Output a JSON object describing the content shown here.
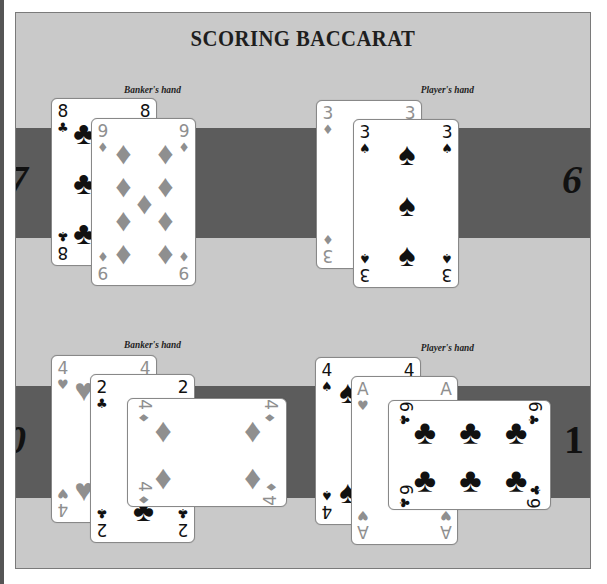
{
  "title": "SCORING BACCARAT",
  "colors": {
    "panel_background": "#c9c9c9",
    "band": "#5c5c5c",
    "black_suit": "#111111",
    "red_suit_grayscale": "#8f8f8f"
  },
  "examples": [
    {
      "banker": {
        "label": "Banker's hand",
        "score": "7",
        "cards": [
          {
            "rank": "8",
            "suit": "clubs",
            "suit_glyph": "♣"
          },
          {
            "rank": "9",
            "suit": "diamonds",
            "suit_glyph": "♦"
          }
        ]
      },
      "player": {
        "label": "Player's hand",
        "score": "6",
        "cards": [
          {
            "rank": "3",
            "suit": "diamonds",
            "suit_glyph": "♦"
          },
          {
            "rank": "3",
            "suit": "spades",
            "suit_glyph": "♠"
          }
        ]
      }
    },
    {
      "banker": {
        "label": "Banker's hand",
        "score": "0",
        "cards": [
          {
            "rank": "4",
            "suit": "hearts",
            "suit_glyph": "♥"
          },
          {
            "rank": "2",
            "suit": "clubs",
            "suit_glyph": "♣"
          },
          {
            "rank": "4",
            "suit": "diamonds",
            "suit_glyph": "♦",
            "orientation": "sideways"
          }
        ]
      },
      "player": {
        "label": "Player's hand",
        "score": "1",
        "cards": [
          {
            "rank": "4",
            "suit": "spades",
            "suit_glyph": "♠"
          },
          {
            "rank": "A",
            "suit": "hearts",
            "suit_glyph": "♥"
          },
          {
            "rank": "6",
            "suit": "clubs",
            "suit_glyph": "♣",
            "orientation": "sideways"
          }
        ]
      }
    }
  ]
}
